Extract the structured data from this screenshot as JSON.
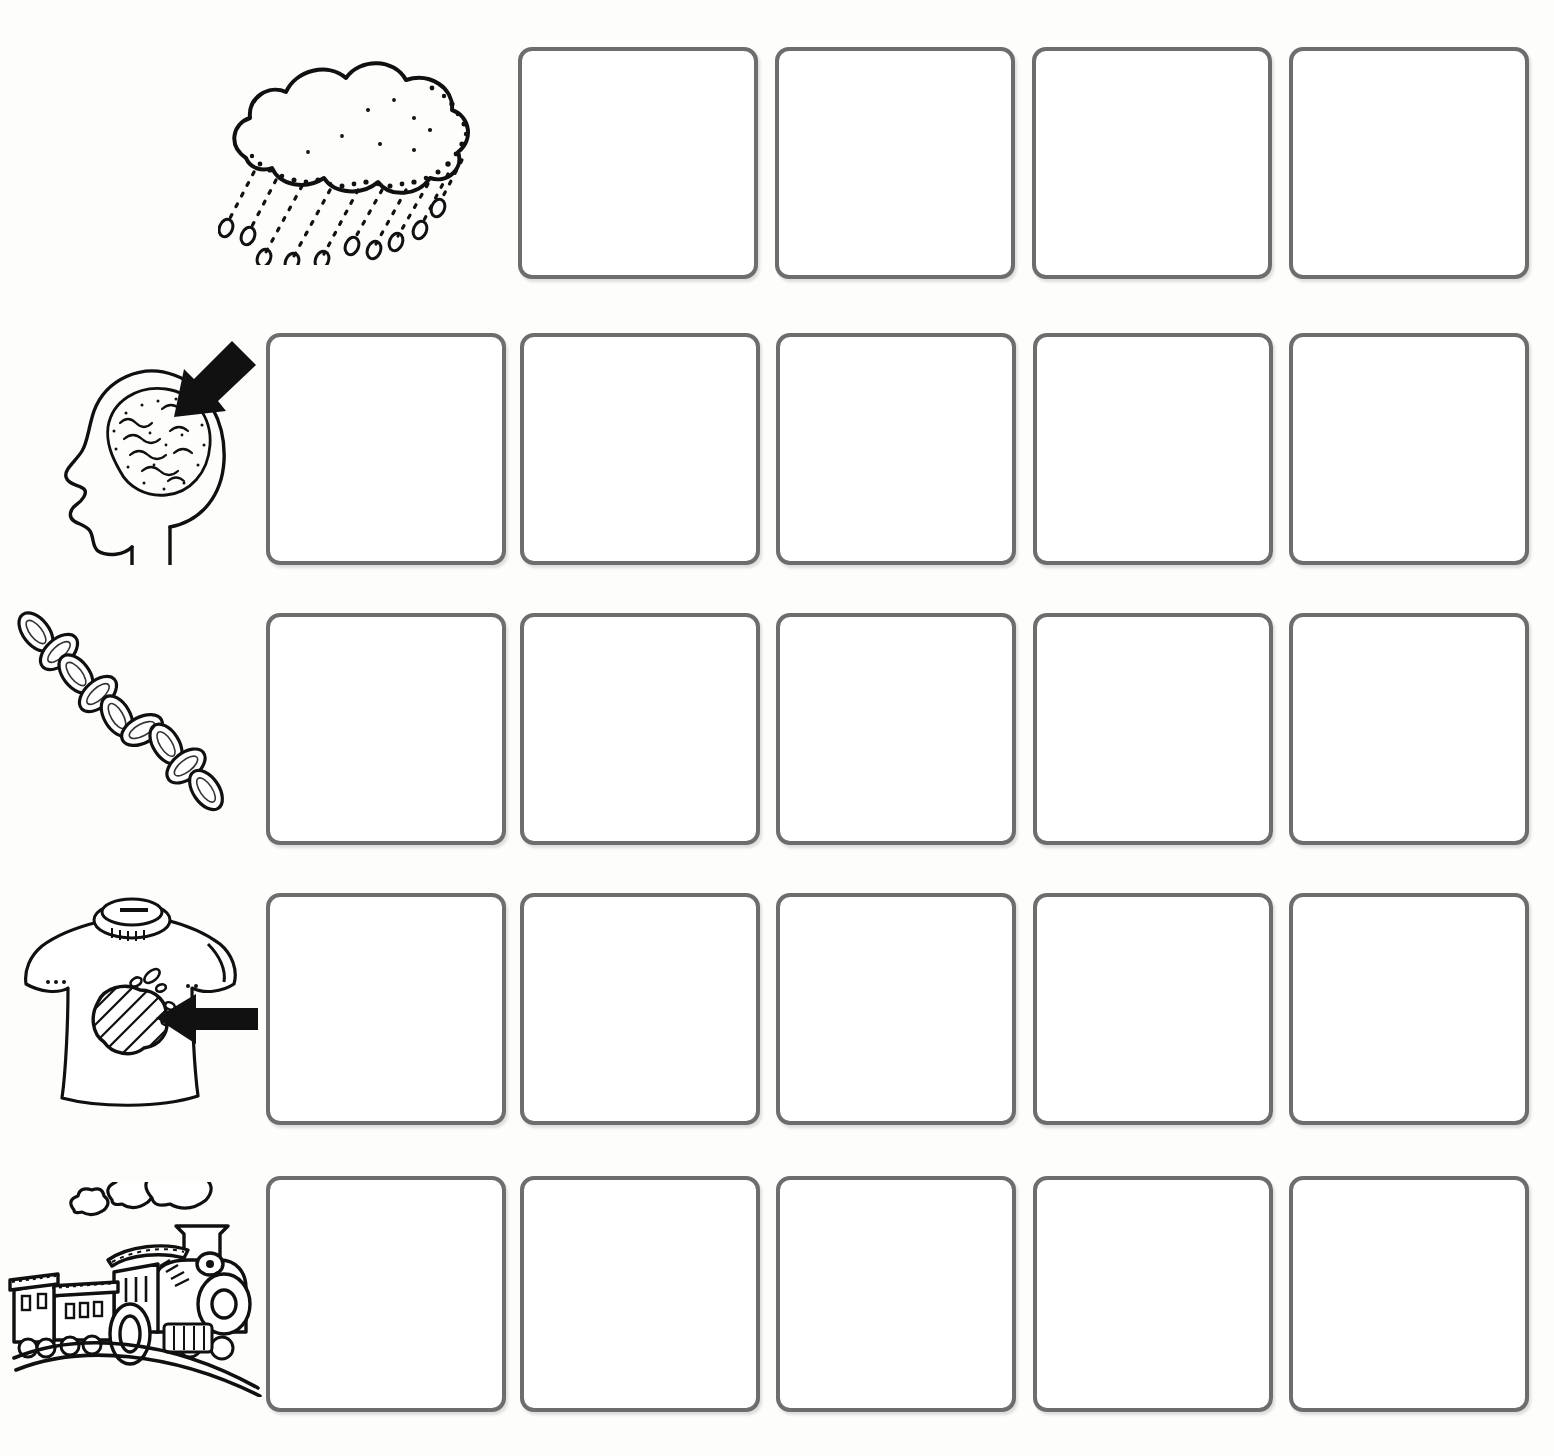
{
  "worksheet": {
    "title": "Picture Sequencing Worksheet",
    "rows_count": 5,
    "columns_count": 5,
    "box_state": "empty",
    "box": {
      "fill_color": "#ffffff",
      "border_color": "#6d6d6d",
      "border_width_px": 4,
      "corner_radius_px": 14,
      "width_px": 240,
      "height_px": 232
    },
    "page_background": "#fdfdfc",
    "ink_color": "#111111"
  },
  "rows": [
    {
      "id": "row-rain-cloud",
      "icon_name": "rain-cloud-icon",
      "icon_label": "rain cloud with falling raindrops",
      "boxes": 4,
      "first_column_index": 2,
      "box_labels": [
        "",
        "",
        "",
        ""
      ]
    },
    {
      "id": "row-brain-head",
      "icon_name": "head-brain-arrow-icon",
      "icon_label": "head in profile showing brain with arrow pointing to it",
      "boxes": 5,
      "first_column_index": 1,
      "box_labels": [
        "",
        "",
        "",
        "",
        ""
      ]
    },
    {
      "id": "row-chain",
      "icon_name": "chain-icon",
      "icon_label": "diagonal chain of linked oval rings",
      "boxes": 5,
      "first_column_index": 1,
      "box_labels": [
        "",
        "",
        "",
        "",
        ""
      ]
    },
    {
      "id": "row-stained-shirt",
      "icon_name": "stained-tshirt-arrow-icon",
      "icon_label": "t-shirt with a stain and arrow pointing at the stain",
      "boxes": 5,
      "first_column_index": 1,
      "box_labels": [
        "",
        "",
        "",
        "",
        ""
      ]
    },
    {
      "id": "row-train",
      "icon_name": "steam-train-icon",
      "icon_label": "steam locomotive with carriages and smoke puffs on a track",
      "boxes": 5,
      "first_column_index": 1,
      "box_labels": [
        "",
        "",
        "",
        "",
        ""
      ]
    }
  ]
}
